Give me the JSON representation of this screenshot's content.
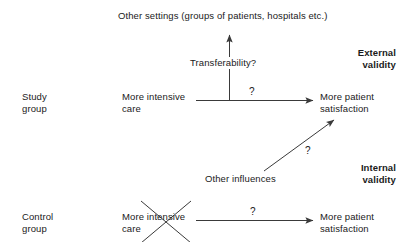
{
  "diagram": {
    "title_text": "Other settings (groups of patients, hospitals etc.)",
    "nodes": {
      "other_settings": "Other settings (groups of patients, hospitals etc.)",
      "transferability": "Transferability?",
      "external_validity": "External\nvalidity",
      "study_group": "Study\ngroup",
      "study_intervention": "More intensive\ncare",
      "study_outcome": "More patient\nsatisfaction",
      "other_influences": "Other influences",
      "internal_validity": "Internal\nvalidity",
      "control_group": "Control\ngroup",
      "control_intervention": "More intensive\ncare",
      "control_outcome": "More patient\nsatisfaction"
    },
    "edge_labels": {
      "study_arrow": "?",
      "diagonal_arrow": "?",
      "control_arrow": "?"
    },
    "colors": {
      "background": "#ffffff",
      "text": "#1a1a1a",
      "line": "#3a3a3a"
    }
  }
}
